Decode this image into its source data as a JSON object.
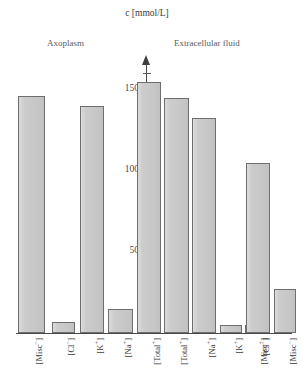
{
  "chart": {
    "axis_title": "c [mmol/L]",
    "caption_left": "Axoplasm",
    "caption_right": "Extracellular fluid"
  },
  "ticks": {
    "labels": [
      "150",
      "100",
      "50"
    ]
  },
  "categories_left": [
    "[Misc⁻]",
    "[Cl⁻]",
    "[K⁺]",
    "[Na⁺]",
    "[Total⁺]"
  ],
  "categories_right": [
    "[Total⁺]",
    "[Na⁺]",
    "[K⁺]",
    "[Misc⁺]",
    "[Cl⁻]",
    "[Misc⁻]"
  ],
  "chart_data": {
    "type": "bar",
    "title": "c [mmol/L]",
    "xlabel": "",
    "ylabel": "c [mmol/L]",
    "ylim": [
      0,
      170
    ],
    "yticks_major": [
      50,
      100,
      150
    ],
    "ytick_minor_step": 10,
    "grid": false,
    "legend": "none",
    "groups": [
      {
        "name": "Axoplasm",
        "categories": [
          "[Misc⁻]",
          "[Cl⁻]",
          "[K⁺]",
          "[Na⁺]",
          "[Total⁺]"
        ],
        "values": [
          146,
          7,
          140,
          15,
          155
        ]
      },
      {
        "name": "Extracellular fluid",
        "categories": [
          "[Total⁺]",
          "[Na⁺]",
          "[K⁺]",
          "[Misc⁺]",
          "[Cl⁻]",
          "[Misc⁻]"
        ],
        "values": [
          145,
          133,
          5,
          5,
          105,
          27
        ]
      }
    ],
    "categories": [
      "[Misc⁻]",
      "[Cl⁻]",
      "[K⁺]",
      "[Na⁺]",
      "[Total⁺]",
      "[Total⁺]",
      "[Na⁺]",
      "[K⁺]",
      "[Misc⁺]",
      "[Cl⁻]",
      "[Misc⁻]"
    ],
    "values": [
      146,
      7,
      140,
      15,
      155,
      145,
      133,
      5,
      5,
      105,
      27
    ],
    "annotations": [
      "Axoplasm",
      "Extracellular fluid"
    ],
    "bar_fill_color": "#c9c9c9",
    "bar_edge_color": "#6e6e6e"
  },
  "bars": [
    {
      "label": "[Misc⁻]",
      "side": "left",
      "value": 146,
      "x": 18,
      "w": 27
    },
    {
      "label": "[Cl⁻]",
      "side": "left",
      "value": 7,
      "x": 52,
      "w": 23
    },
    {
      "label": "[K⁺]",
      "side": "left",
      "value": 140,
      "x": 80,
      "w": 24
    },
    {
      "label": "[Na⁺]",
      "side": "left",
      "value": 15,
      "x": 108,
      "w": 25
    },
    {
      "label": "[Total⁺]",
      "side": "left",
      "value": 155,
      "x": 137,
      "w": 24
    },
    {
      "label": "[Total⁺]",
      "side": "right",
      "value": 145,
      "x": 164,
      "w": 25
    },
    {
      "label": "[Na⁺]",
      "side": "right",
      "value": 133,
      "x": 192,
      "w": 24
    },
    {
      "label": "[K⁺]",
      "side": "right",
      "value": 5,
      "x": 220,
      "w": 22
    },
    {
      "label": "[Misc⁺]",
      "side": "right",
      "value": 5,
      "x": 245,
      "w": 22
    },
    {
      "label": "[Cl⁻]",
      "side": "right",
      "value": 105,
      "x": 246,
      "w": 24
    },
    {
      "label": "[Misc⁻]",
      "side": "right",
      "value": 27,
      "x": 274,
      "w": 22
    }
  ]
}
